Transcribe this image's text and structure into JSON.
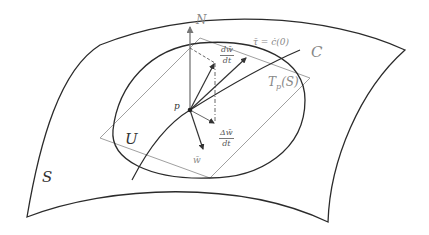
{
  "figure": {
    "labels": {
      "surface": "S",
      "region": "U",
      "point": "p",
      "normal": "N",
      "curve": "C",
      "tangent_plane": "Tp(S)",
      "tangent_plane_main": "T",
      "tangent_plane_sub": "p",
      "tangent_plane_arg": "(S)",
      "tau": "τ̄ = ċ(0)",
      "w": "w̄",
      "dw_dt_num": "dw̄",
      "dw_dt_den": "dt",
      "delta_w_dt_num": "Δw̄",
      "delta_w_dt_den": "dt"
    },
    "colors": {
      "outline": "#2b2b2b",
      "plane": "#9a9a9a",
      "vector": "#3a3a3a",
      "background": "#ffffff"
    }
  }
}
